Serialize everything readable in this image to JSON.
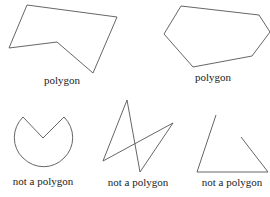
{
  "figures": [
    {
      "label": "polygon",
      "shape": "concave-pentagon",
      "is_polygon": true
    },
    {
      "label": "polygon",
      "shape": "convex-hexagon",
      "is_polygon": true
    },
    {
      "label": "not a polygon",
      "shape": "curved-pacman",
      "is_polygon": false
    },
    {
      "label": "not a polygon",
      "shape": "self-intersecting",
      "is_polygon": false
    },
    {
      "label": "not a polygon",
      "shape": "open-figure",
      "is_polygon": false
    }
  ],
  "colors": {
    "stroke": "#555555",
    "text": "#222222",
    "background": "#ffffff"
  }
}
